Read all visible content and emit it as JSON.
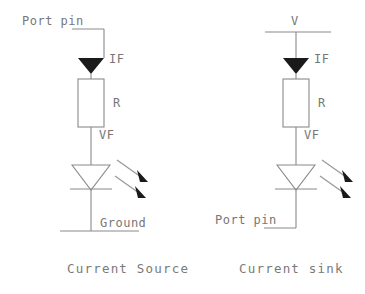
{
  "diagram": {
    "title_absent": true,
    "circuits": [
      {
        "id": "current-source",
        "caption": "Current Source",
        "top_label": "Port pin",
        "current_label": "IF",
        "resistor_label": "R",
        "forward_voltage_label": "VF",
        "bottom_label": "Ground",
        "components": [
          "current-arrow",
          "resistor",
          "led",
          "ground-rail"
        ],
        "emission_arrows": 2
      },
      {
        "id": "current-sink",
        "caption": "Current sink",
        "top_label": "V",
        "current_label": "IF",
        "resistor_label": "R",
        "forward_voltage_label": "VF",
        "bottom_label": "Port pin",
        "components": [
          "supply-rail",
          "current-arrow",
          "resistor",
          "led"
        ],
        "emission_arrows": 2
      }
    ],
    "colors": {
      "line": "#8a8a8a",
      "text": "#777777",
      "fill_solid": "#1a1a1a",
      "background": "#ffffff"
    }
  }
}
